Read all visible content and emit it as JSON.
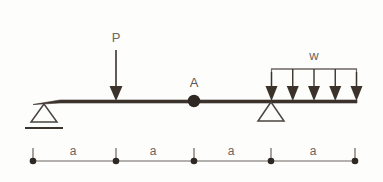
{
  "figure": {
    "name": "beam-free-body-diagram",
    "labels": {
      "point_load": "P",
      "hinge": "A",
      "distributed_load": "w",
      "dim_1": "a",
      "dim_2": "a",
      "dim_3": "a",
      "dim_4": "a"
    },
    "colors": {
      "beam": "#3b322b",
      "line": "#6b6560",
      "text": "#6b6560",
      "background": "#fdfdfc",
      "node": "#2f2822"
    },
    "geometry": {
      "beam_left_x": 33,
      "beam_right_x": 357,
      "beam_y": 101,
      "left_support_x": 44,
      "hinge_x": 194,
      "right_support_x": 271,
      "point_load_x": 116,
      "distributed_load_start_x": 271,
      "distributed_load_end_x": 357,
      "distributed_arrow_count": 5,
      "dimension_line_y": 161,
      "dimension_nodes_x": [
        33,
        116,
        194,
        271,
        355
      ]
    },
    "supports": [
      {
        "type": "roller-with-ground",
        "position_label": "left-end"
      },
      {
        "type": "pin-triangle",
        "position_label": "interior"
      }
    ],
    "loads": [
      {
        "type": "concentrated-downward",
        "label": "P"
      },
      {
        "type": "uniform-distributed-downward",
        "label": "w",
        "arrows": 5
      }
    ],
    "nodes": [
      {
        "type": "internal-hinge",
        "label": "A"
      }
    ]
  }
}
